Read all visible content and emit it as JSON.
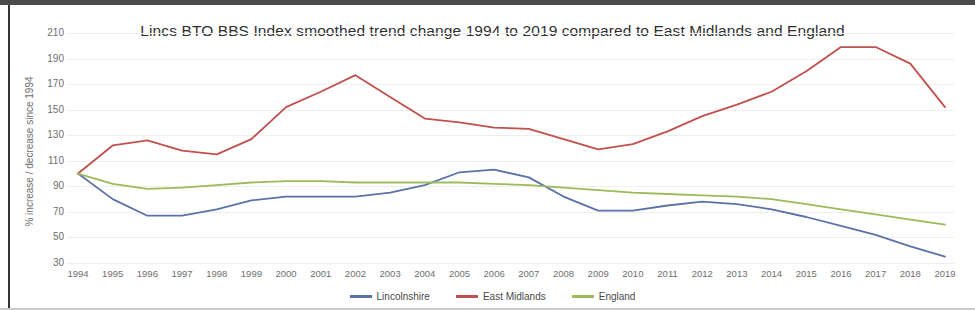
{
  "chart_data": {
    "type": "line",
    "title": "Lincs BTO BBS Index smoothed trend change 1994 to 2019 compared to East Midlands and England",
    "xlabel": "",
    "ylabel": "% increase / decrease since 1994",
    "x": [
      1994,
      1995,
      1996,
      1997,
      1998,
      1999,
      2000,
      2001,
      2002,
      2003,
      2004,
      2005,
      2006,
      2007,
      2008,
      2009,
      2010,
      2011,
      2012,
      2013,
      2014,
      2015,
      2016,
      2017,
      2018,
      2019
    ],
    "categories": [
      "1994",
      "1995",
      "1996",
      "1997",
      "1998",
      "1999",
      "2000",
      "2001",
      "2002",
      "2003",
      "2004",
      "2005",
      "2006",
      "2007",
      "2008",
      "2009",
      "2010",
      "2011",
      "2012",
      "2013",
      "2014",
      "2015",
      "2016",
      "2017",
      "2018",
      "2019"
    ],
    "ylim": [
      30,
      210
    ],
    "yticks": [
      30,
      50,
      70,
      90,
      110,
      130,
      150,
      170,
      190,
      210
    ],
    "grid": true,
    "legend_position": "bottom",
    "series": [
      {
        "name": "Lincolnshire",
        "color": "#5b72a8",
        "values": [
          100,
          80,
          67,
          67,
          72,
          79,
          82,
          82,
          82,
          85,
          91,
          101,
          103,
          97,
          82,
          71,
          71,
          75,
          78,
          76,
          72,
          66,
          59,
          52,
          43,
          35
        ]
      },
      {
        "name": "East Midlands",
        "color": "#c0504d",
        "values": [
          100,
          122,
          126,
          118,
          115,
          127,
          152,
          164,
          177,
          160,
          143,
          140,
          136,
          135,
          127,
          119,
          123,
          133,
          145,
          154,
          164,
          180,
          199,
          199,
          186,
          152
        ]
      },
      {
        "name": "England",
        "color": "#9bbb59",
        "values": [
          100,
          92,
          88,
          89,
          91,
          93,
          94,
          94,
          93,
          93,
          93,
          93,
          92,
          91,
          89,
          87,
          85,
          84,
          83,
          82,
          80,
          76,
          72,
          68,
          64,
          60
        ]
      }
    ]
  },
  "legend": {
    "items": [
      {
        "label": "Lincolnshire",
        "color": "#5b72a8"
      },
      {
        "label": "East Midlands",
        "color": "#c0504d"
      },
      {
        "label": "England",
        "color": "#9bbb59"
      }
    ]
  }
}
